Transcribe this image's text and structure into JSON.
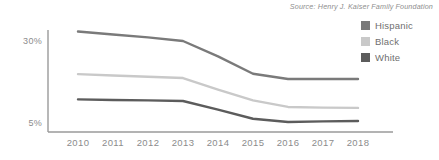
{
  "source_note": "Source: Henry J. Kaiser Family Foundation",
  "legend": {
    "position": "right",
    "items": [
      {
        "label": "Hispanic",
        "color": "#7a7a7a"
      },
      {
        "label": "Black",
        "color": "#c9c9c9"
      },
      {
        "label": "White",
        "color": "#5c5c5c"
      }
    ]
  },
  "axes": {
    "y_ticks": [
      "30%",
      "5%"
    ],
    "x_ticks": [
      "2010",
      "2011",
      "2012",
      "2013",
      "2014",
      "2015",
      "2016",
      "2017",
      "2018"
    ]
  },
  "chart_data": {
    "type": "line",
    "title": "",
    "subtitle": "",
    "xlabel": "",
    "ylabel": "",
    "x": [
      2010,
      2011,
      2012,
      2013,
      2014,
      2015,
      2016,
      2017,
      2018
    ],
    "categories": [
      "2010",
      "2011",
      "2012",
      "2013",
      "2014",
      "2015",
      "2016",
      "2017",
      "2018"
    ],
    "series": [
      {
        "name": "Hispanic",
        "color": "#7a7a7a",
        "values": [
          32.9,
          32.0,
          31.1,
          30.0,
          25.3,
          20.0,
          18.4,
          18.4,
          18.4
        ]
      },
      {
        "name": "Black",
        "color": "#c9c9c9",
        "values": [
          19.9,
          19.5,
          19.1,
          18.7,
          15.2,
          11.9,
          9.9,
          9.7,
          9.6
        ]
      },
      {
        "name": "White",
        "color": "#5c5c5c",
        "values": [
          12.2,
          12.0,
          11.9,
          11.7,
          9.1,
          6.3,
          5.3,
          5.5,
          5.6
        ]
      }
    ],
    "ylim": [
      3.5,
      34.5
    ],
    "xlim": [
      2010,
      2018
    ],
    "grid": false,
    "legend_position": "right",
    "annotations": [
      "Source: Henry J. Kaiser Family Foundation"
    ]
  }
}
